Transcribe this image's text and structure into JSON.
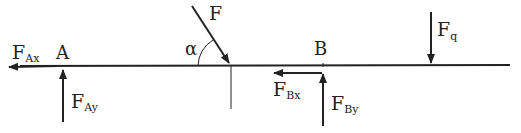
{
  "diagram": {
    "colors": {
      "line": "#222222",
      "background": "#ffffff"
    },
    "points": {
      "A": {
        "label": "A"
      },
      "B": {
        "label": "B"
      }
    },
    "forces": {
      "F": {
        "main": "F",
        "sub": ""
      },
      "FAx": {
        "main": "F",
        "sub": "Ax"
      },
      "FAy": {
        "main": "F",
        "sub": "Ay"
      },
      "FBx": {
        "main": "F",
        "sub": "Bx"
      },
      "FBy": {
        "main": "F",
        "sub": "By"
      },
      "Fq": {
        "main": "F",
        "sub": "q"
      }
    },
    "angle": {
      "label": "α"
    }
  }
}
